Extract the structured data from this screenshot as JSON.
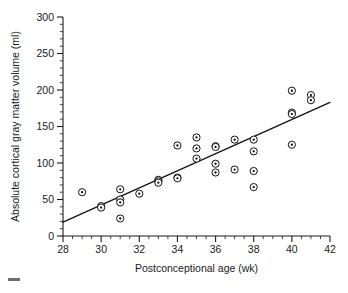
{
  "figure": {
    "background_color": "#ffffff",
    "ink_color": "#1a1a1a"
  },
  "chart_data": {
    "type": "scatter",
    "title": "",
    "subtitle": "",
    "xlabel": "Postconceptional age (wk)",
    "ylabel": "Absolute cortical gray matter volume (ml)",
    "xlim": [
      28,
      42
    ],
    "ylim": [
      0,
      300
    ],
    "xticks": [
      28,
      30,
      32,
      34,
      36,
      38,
      40,
      42
    ],
    "xticklabels": [
      "28",
      "30",
      "32",
      "34",
      "36",
      "38",
      "40",
      "42"
    ],
    "yticks": [
      0,
      50,
      100,
      150,
      200,
      250,
      300
    ],
    "yticklabels": [
      "0",
      "50",
      "100",
      "150",
      "200",
      "250",
      "300"
    ],
    "x_minor_step": 0.5,
    "y_minor_step": 10,
    "grid": false,
    "legend": null,
    "marker": "circle-with-dot",
    "marker_size_px": 7,
    "series": [
      {
        "name": "Infants",
        "x": [
          29,
          30,
          30,
          31,
          31,
          31,
          31,
          32,
          33,
          33,
          33,
          34,
          34,
          34,
          35,
          35,
          35,
          36,
          36,
          36,
          36,
          37,
          37,
          38,
          38,
          38,
          38,
          40,
          40,
          40,
          40,
          41,
          41
        ],
        "y": [
          60,
          41,
          39,
          64,
          50,
          46,
          24,
          58,
          77,
          75,
          73,
          124,
          80,
          79,
          135,
          120,
          106,
          123,
          122,
          99,
          87,
          132,
          91,
          132,
          116,
          89,
          67,
          199,
          169,
          167,
          125,
          193,
          186
        ]
      }
    ],
    "fit_line": {
      "name": "Least-squares regression line",
      "x_start": 28.0,
      "y_start": 19,
      "x_end": 42.0,
      "y_end": 183
    }
  }
}
